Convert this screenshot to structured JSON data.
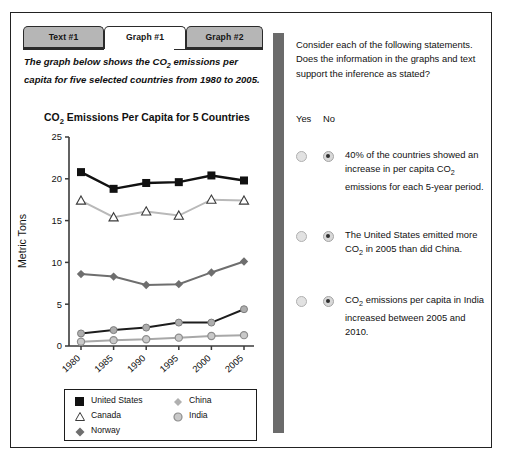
{
  "tabs": [
    {
      "label": "Text #1",
      "active": false
    },
    {
      "label": "Graph #1",
      "active": true
    },
    {
      "label": "Graph #2",
      "active": false
    }
  ],
  "intro": {
    "line1_a": "The graph below shows the CO",
    "line1_sub": "2",
    "line1_b": " emissions per",
    "line2": "capita for five selected countries from 1980 to 2005."
  },
  "chart_data": {
    "type": "line",
    "title_a": "CO",
    "title_sub": "2",
    "title_b": " Emissions Per Capita for 5 Countries",
    "title": "CO2 Emissions Per Capita for 5 Countries",
    "xlabel": "",
    "ylabel": "Metric Tons",
    "categories": [
      "1980",
      "1985",
      "1990",
      "1995",
      "2000",
      "2005"
    ],
    "x": [
      1980,
      1985,
      1990,
      1995,
      2000,
      2005
    ],
    "ylim": [
      0,
      25
    ],
    "yticks": [
      0,
      5,
      10,
      15,
      20,
      25
    ],
    "grid": false,
    "legend_position": "below-plot",
    "series": [
      {
        "name": "United States",
        "marker": "filled-square",
        "color": "#111111",
        "values": [
          20.8,
          18.8,
          19.5,
          19.6,
          20.4,
          19.8
        ]
      },
      {
        "name": "Canada",
        "marker": "open-triangle",
        "color": "#b9b9b9",
        "values": [
          17.4,
          15.4,
          16.1,
          15.6,
          17.5,
          17.4
        ]
      },
      {
        "name": "Norway",
        "marker": "filled-diamond",
        "color": "#6e6e6e",
        "values": [
          8.6,
          8.3,
          7.3,
          7.4,
          8.8,
          10.1
        ]
      },
      {
        "name": "China",
        "marker": "filled-circle-dk",
        "color": "#1d1d1d",
        "values": [
          1.5,
          1.9,
          2.2,
          2.8,
          2.8,
          4.4
        ]
      },
      {
        "name": "India",
        "marker": "filled-circle-lt",
        "color": "#a8a8a8",
        "values": [
          0.5,
          0.7,
          0.8,
          1.0,
          1.2,
          1.3
        ]
      }
    ]
  },
  "legend": {
    "united_states": "United States",
    "canada": "Canada",
    "norway": "Norway",
    "china": "China",
    "india": "India"
  },
  "right_panel": {
    "instructions": "Consider each of the following statements. Does the information in the graphs and text support the inference as stated?",
    "yes_label": "Yes",
    "no_label": "No",
    "statements": [
      {
        "selected": "No",
        "text_a": "40% of the countries showed an increase in per capita CO",
        "text_sub": "2",
        "text_b": " emissions for each 5-year period."
      },
      {
        "selected": "No",
        "text_a": "The United States emitted more CO",
        "text_sub": "2",
        "text_b": " in 2005 than did China."
      },
      {
        "selected": "No",
        "text_a": "CO",
        "text_sub": "2",
        "text_b": " emissions per capita in India increased between 2005 and 2010."
      }
    ]
  },
  "colors": {
    "frame_border": "#222222",
    "tab_inactive": "#b9b9b9",
    "tab_active": "#ffffff",
    "divider": "#6b6b6b"
  }
}
